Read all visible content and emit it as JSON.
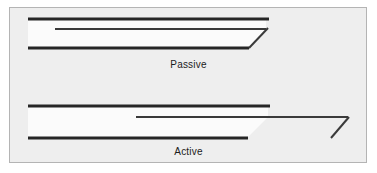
{
  "figure": {
    "width": 377,
    "height": 173,
    "background_color": "#ffffff",
    "panel_fill_color": "#eeeeee",
    "panel_border_color": "#b4b4b4",
    "line_color": "#262626",
    "light_fill_color": "#fbfbfb"
  },
  "panels": [
    {
      "id": "passive",
      "label": "Passive",
      "label_x": 188,
      "label_y": 59,
      "elements": [
        {
          "name": "upper-bar",
          "type": "line",
          "x1": 28,
          "y1": 19,
          "x2": 269,
          "y2": 19,
          "thickness": 3
        },
        {
          "name": "middle-bar",
          "type": "line",
          "x1": 55,
          "y1": 29,
          "x2": 266,
          "y2": 29,
          "thickness": 2
        },
        {
          "name": "lower-bar",
          "type": "line",
          "x1": 28,
          "y1": 48,
          "x2": 249,
          "y2": 48,
          "thickness": 3
        },
        {
          "name": "arrow-diagonal",
          "type": "line",
          "x1": 249,
          "y1": 48,
          "x2": 268,
          "y2": 28,
          "thickness": 2
        },
        {
          "name": "light-region",
          "type": "polygon",
          "points": "28,20 266,20 266,29 249,47 28,47",
          "fill": "#fbfbfb"
        }
      ]
    },
    {
      "id": "active",
      "label": "Active",
      "label_x": 188,
      "label_y": 146,
      "elements": [
        {
          "name": "upper-bar",
          "type": "line",
          "x1": 28,
          "y1": 106,
          "x2": 270,
          "y2": 106,
          "thickness": 3
        },
        {
          "name": "middle-bar",
          "type": "line",
          "x1": 136,
          "y1": 117,
          "x2": 348,
          "y2": 117,
          "thickness": 2
        },
        {
          "name": "lower-bar",
          "type": "line",
          "x1": 28,
          "y1": 138,
          "x2": 248,
          "y2": 138,
          "thickness": 3
        },
        {
          "name": "arrow-diagonal",
          "type": "line",
          "x1": 331,
          "y1": 138,
          "x2": 349,
          "y2": 117,
          "thickness": 2
        },
        {
          "name": "light-region",
          "type": "polygon",
          "points": "28,107 268,107 268,117 248,137 28,137",
          "fill": "#fbfbfb"
        }
      ]
    }
  ]
}
